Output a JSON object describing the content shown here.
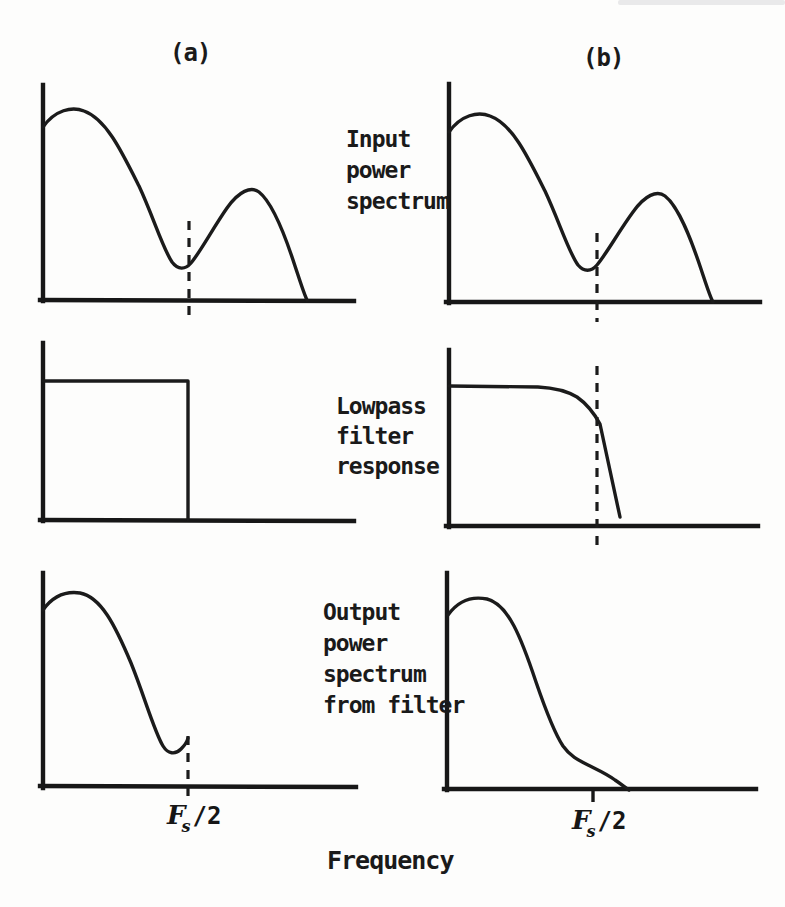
{
  "palette": {
    "ink": "#1b1b1b",
    "paper": "#fdfdfc"
  },
  "labels": {
    "col_a": "(a)",
    "col_b": "(b)",
    "row1_lines": [
      "Input",
      "power",
      "spectrum"
    ],
    "row2_lines": [
      "Lowpass",
      "filter",
      "response"
    ],
    "row3_lines": [
      "Output",
      "power",
      "spectrum",
      "from filter"
    ],
    "cutoff_symbol": "F",
    "cutoff_subscript": "s",
    "cutoff_rest": "/2",
    "x_axis_label": "Frequency"
  },
  "plots": {
    "a1_curve": "M 43 127 C 55 110 72 106 84 111 C 106 119 121 150 139 186 C 153 216 163 249 172 262 C 178 270 185 270 191 263 C 201 251 213 228 227 208 C 239 191 251 186 259 192 C 273 203 285 235 295 266 C 300 281 304 294 307 300",
    "b1_curve": "M 449 132 C 461 115 478 111 490 116 C 512 124 527 155 545 191 C 559 221 569 253 578 265 C 584 272 591 272 597 265 C 607 253 619 231 633 212 C 645 195 657 190 665 196 C 679 207 691 239 701 269 C 706 284 710 297 713 302",
    "a2_curve": "M 43 381 L 188 381 L 188 519",
    "b2_curve": "M 449 386 L 538 387 C 556 388 567 391 577 397 C 587 404 594 413 600 424 L 620 517",
    "a3_curve": "M 43 610 C 53 596 66 591 80 593 C 101 597 115 625 131 663 C 144 695 154 731 163 746 C 168 754 175 755 181 749 C 184 746 187 743 188 738",
    "b3_curve": "M 448 615 C 458 601 472 596 487 599 C 508 604 521 637 536 682 C 547 714 555 734 563 746 C 570 756 578 760 588 765 C 598 770 607 774 615 780 C 621 784 626 788 629 790"
  }
}
